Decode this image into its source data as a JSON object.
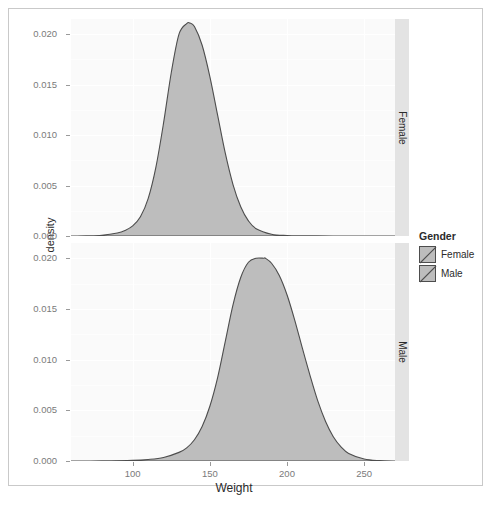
{
  "chart_data": {
    "type": "area",
    "title": "",
    "xlabel": "Weight",
    "ylabel": "density",
    "xlim": [
      60,
      270
    ],
    "ylim": [
      0,
      0.0215
    ],
    "grid": true,
    "legend": {
      "title": "Gender",
      "position": "right",
      "entries": [
        {
          "label": "Female",
          "fill": "#bdbdbd",
          "line": "#4d4d4d"
        },
        {
          "label": "Male",
          "fill": "#bdbdbd",
          "line": "#4d4d4d"
        }
      ]
    },
    "facets": [
      {
        "strip_label": "Female",
        "series_name": "Female",
        "ytick_labels": [
          "0.000",
          "0.005",
          "0.010",
          "0.015",
          "0.020"
        ],
        "ytick_values": [
          0.0,
          0.005,
          0.01,
          0.015,
          0.02
        ],
        "peak_x": 137,
        "peak_y": 0.0211,
        "x": [
          60,
          70,
          80,
          90,
          95,
          100,
          105,
          110,
          115,
          120,
          125,
          130,
          135,
          137,
          140,
          145,
          150,
          155,
          160,
          165,
          170,
          175,
          180,
          190,
          200,
          210,
          220,
          230,
          240,
          250,
          260,
          270
        ],
        "y": [
          0.0,
          2e-05,
          8e-05,
          0.0003,
          0.00055,
          0.001,
          0.0019,
          0.0037,
          0.0068,
          0.0112,
          0.0162,
          0.02,
          0.02105,
          0.0211,
          0.02075,
          0.0189,
          0.0158,
          0.012,
          0.0082,
          0.0051,
          0.0029,
          0.0015,
          0.00072,
          0.00018,
          5e-05,
          2e-05,
          1e-05,
          0.0,
          0.0,
          0.0,
          0.0,
          0.0
        ]
      },
      {
        "strip_label": "Male",
        "series_name": "Male",
        "ytick_labels": [
          "0.000",
          "0.005",
          "0.010",
          "0.015",
          "0.020"
        ],
        "ytick_values": [
          0.0,
          0.005,
          0.01,
          0.015,
          0.02
        ],
        "peak_x": 186,
        "peak_y": 0.02,
        "x": [
          60,
          80,
          100,
          110,
          120,
          130,
          135,
          140,
          145,
          150,
          155,
          160,
          165,
          170,
          175,
          180,
          185,
          186,
          190,
          195,
          200,
          205,
          210,
          215,
          220,
          225,
          230,
          235,
          240,
          250,
          260,
          270
        ],
        "y": [
          0.0,
          1e-05,
          6e-05,
          0.00015,
          0.00035,
          0.00085,
          0.0013,
          0.0021,
          0.0034,
          0.0054,
          0.0082,
          0.0118,
          0.0154,
          0.0181,
          0.0196,
          0.02,
          0.02,
          0.02,
          0.0195,
          0.0183,
          0.0164,
          0.0139,
          0.0111,
          0.0084,
          0.0059,
          0.0039,
          0.0024,
          0.0014,
          0.00075,
          0.0002,
          4e-05,
          0.0
        ]
      }
    ],
    "xtick_labels": [
      "100",
      "150",
      "200",
      "250"
    ],
    "xtick_values": [
      100,
      150,
      200,
      250
    ]
  }
}
